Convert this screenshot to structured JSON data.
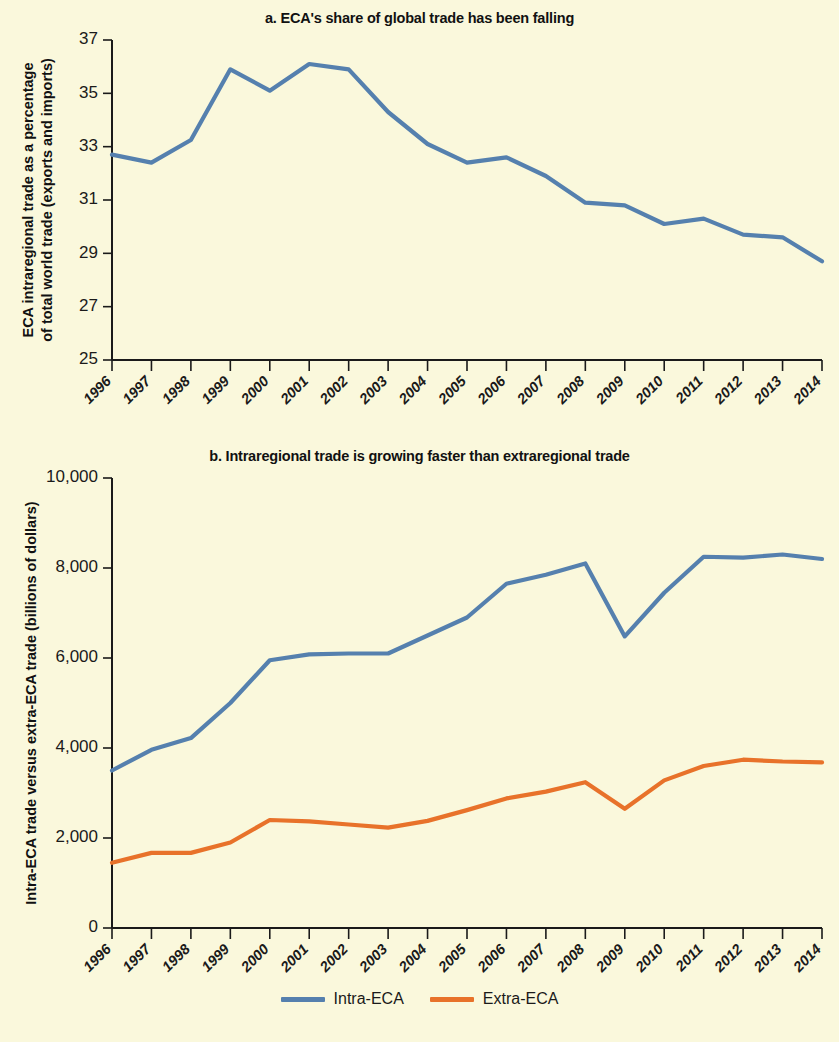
{
  "figure": {
    "background_color": "#FAF8DC"
  },
  "panel_a": {
    "title": "a. ECA's share of global trade has been falling",
    "ylabel_line1": "ECA intraregional trade as a percentage",
    "ylabel_line2": "of total world trade (exports and imports)"
  },
  "panel_b": {
    "title": "b. Intraregional trade is growing faster than extraregional trade",
    "ylabel_line1": "Intra-ECA trade versus extra-ECA trade (billions of dollars)"
  },
  "legend": {
    "items": [
      {
        "label": "Intra-ECA",
        "color": "#5580AE"
      },
      {
        "label": "Extra-ECA",
        "color": "#E8722A"
      }
    ]
  },
  "chart_data": [
    {
      "type": "line",
      "panel": "a",
      "title": "a. ECA's share of global trade has been falling",
      "xlabel": "",
      "ylabel": "ECA intraregional trade as a percentage of total world trade (exports and imports)",
      "x": [
        "1996",
        "1997",
        "1998",
        "1999",
        "2000",
        "2001",
        "2002",
        "2003",
        "2004",
        "2005",
        "2006",
        "2007",
        "2008",
        "2009",
        "2010",
        "2011",
        "2012",
        "2013",
        "2014"
      ],
      "xtick_labels": [
        "1996",
        "1997",
        "1998",
        "1999",
        "2000",
        "2001",
        "2002",
        "2003",
        "2004",
        "2005",
        "2006",
        "2007",
        "2008",
        "2009",
        "2010",
        "2011",
        "2012",
        "2013",
        "2014"
      ],
      "ylim": [
        25,
        37
      ],
      "ytick_labels": [
        "25",
        "27",
        "29",
        "31",
        "33",
        "35",
        "37"
      ],
      "yticks": [
        25,
        27,
        29,
        31,
        33,
        35,
        37
      ],
      "grid": false,
      "legend_position": "none",
      "series": [
        {
          "name": "ECA intraregional trade share",
          "color": "#5580AE",
          "values": [
            32.7,
            32.4,
            33.25,
            35.9,
            35.1,
            36.1,
            35.9,
            34.3,
            33.1,
            32.4,
            32.6,
            31.9,
            30.9,
            30.8,
            30.1,
            30.3,
            29.7,
            29.6,
            28.7
          ]
        }
      ]
    },
    {
      "type": "line",
      "panel": "b",
      "title": "b. Intraregional trade is growing faster than extraregional trade",
      "xlabel": "",
      "ylabel": "Intra-ECA trade versus extra-ECA trade (billions of dollars)",
      "x": [
        "1996",
        "1997",
        "1998",
        "1999",
        "2000",
        "2001",
        "2002",
        "2003",
        "2004",
        "2005",
        "2006",
        "2007",
        "2008",
        "2009",
        "2010",
        "2011",
        "2012",
        "2013",
        "2014"
      ],
      "xtick_labels": [
        "1996",
        "1997",
        "1998",
        "1999",
        "2000",
        "2001",
        "2002",
        "2003",
        "2004",
        "2005",
        "2006",
        "2007",
        "2008",
        "2009",
        "2010",
        "2011",
        "2012",
        "2013",
        "2014"
      ],
      "ylim": [
        0,
        10000
      ],
      "ytick_labels": [
        "0",
        "2,000",
        "4,000",
        "6,000",
        "8,000",
        "10,000"
      ],
      "yticks": [
        0,
        2000,
        4000,
        6000,
        8000,
        10000
      ],
      "grid": false,
      "legend_position": "bottom",
      "series": [
        {
          "name": "Intra-ECA",
          "color": "#5580AE",
          "values": [
            3500,
            3960,
            4220,
            5000,
            5950,
            6080,
            6100,
            6100,
            6500,
            6900,
            7650,
            7850,
            8100,
            6480,
            7450,
            8250,
            8230,
            8300,
            8200
          ]
        },
        {
          "name": "Extra-ECA",
          "color": "#E8722A",
          "values": [
            1450,
            1670,
            1670,
            1900,
            2400,
            2370,
            2300,
            2230,
            2380,
            2620,
            2880,
            3030,
            3240,
            2650,
            3280,
            3600,
            3740,
            3700,
            3680
          ]
        }
      ]
    }
  ]
}
